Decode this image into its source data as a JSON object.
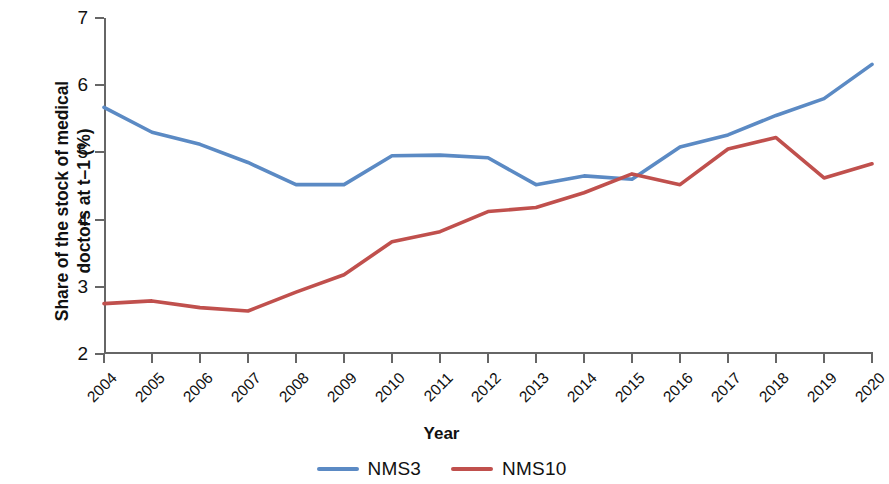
{
  "chart_data": {
    "type": "line",
    "title": "",
    "xlabel": "Year",
    "ylabel": "Share of the stock of medical\ndoctors at t–1 (%)",
    "categories": [
      "2004",
      "2005",
      "2006",
      "2007",
      "2008",
      "2009",
      "2010",
      "2011",
      "2012",
      "2013",
      "2014",
      "2015",
      "2016",
      "2017",
      "2018",
      "2019",
      "2020"
    ],
    "x": [
      2004,
      2005,
      2006,
      2007,
      2008,
      2009,
      2010,
      2011,
      2012,
      2013,
      2014,
      2015,
      2016,
      2017,
      2018,
      2019,
      2020
    ],
    "series": [
      {
        "name": "NMS3",
        "color": "#5b8ac4",
        "values": [
          5.67,
          5.3,
          5.12,
          4.85,
          4.52,
          4.52,
          4.95,
          4.96,
          4.92,
          4.52,
          4.65,
          4.6,
          5.08,
          5.26,
          5.55,
          5.8,
          6.31
        ]
      },
      {
        "name": "NMS10",
        "color": "#c0504d",
        "values": [
          2.75,
          2.79,
          2.69,
          2.64,
          2.92,
          3.18,
          3.67,
          3.82,
          4.12,
          4.18,
          4.4,
          4.68,
          4.52,
          5.05,
          5.22,
          4.62,
          4.83
        ]
      }
    ],
    "ylim": [
      2,
      7
    ],
    "yticks": [
      2,
      3,
      4,
      5,
      6,
      7
    ],
    "ytick_labels": [
      "2",
      "3",
      "4",
      "5",
      "6",
      "7"
    ],
    "xlim": [
      2004,
      2020
    ],
    "grid": false,
    "legend_position": "bottom-center",
    "axis_color": "#666666"
  },
  "legend": {
    "items": [
      {
        "label": "NMS3",
        "color": "#5b8ac4"
      },
      {
        "label": "NMS10",
        "color": "#c0504d"
      }
    ]
  }
}
